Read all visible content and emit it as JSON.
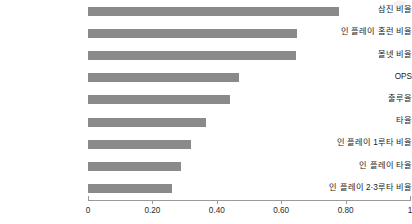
{
  "chart_data": {
    "type": "bar",
    "orientation": "horizontal",
    "title": "",
    "subtitle": "",
    "xlabel": "",
    "ylabel": "",
    "xlim": [
      0,
      1
    ],
    "grid": false,
    "legend": null,
    "bar_color": "#8a8a8a",
    "axis_color": "#9a9a9a",
    "text_color": "#1a1a1a",
    "xticks": [
      0,
      0.2,
      0.4,
      0.6,
      0.8,
      1
    ],
    "xtick_labels": [
      "0",
      "0.20",
      "0.40",
      "0.60",
      "0.80",
      "1"
    ],
    "categories": [
      "삼진 비율",
      "인 플레이 홈런 비율",
      "볼넷 비율",
      "OPS",
      "출루율",
      "타율",
      "인 플레이 1루타 비율",
      "인 플레이 타율",
      "인 플레이 2·3루타 비율"
    ],
    "values": [
      0.78,
      0.65,
      0.645,
      0.47,
      0.44,
      0.365,
      0.32,
      0.29,
      0.26
    ]
  }
}
